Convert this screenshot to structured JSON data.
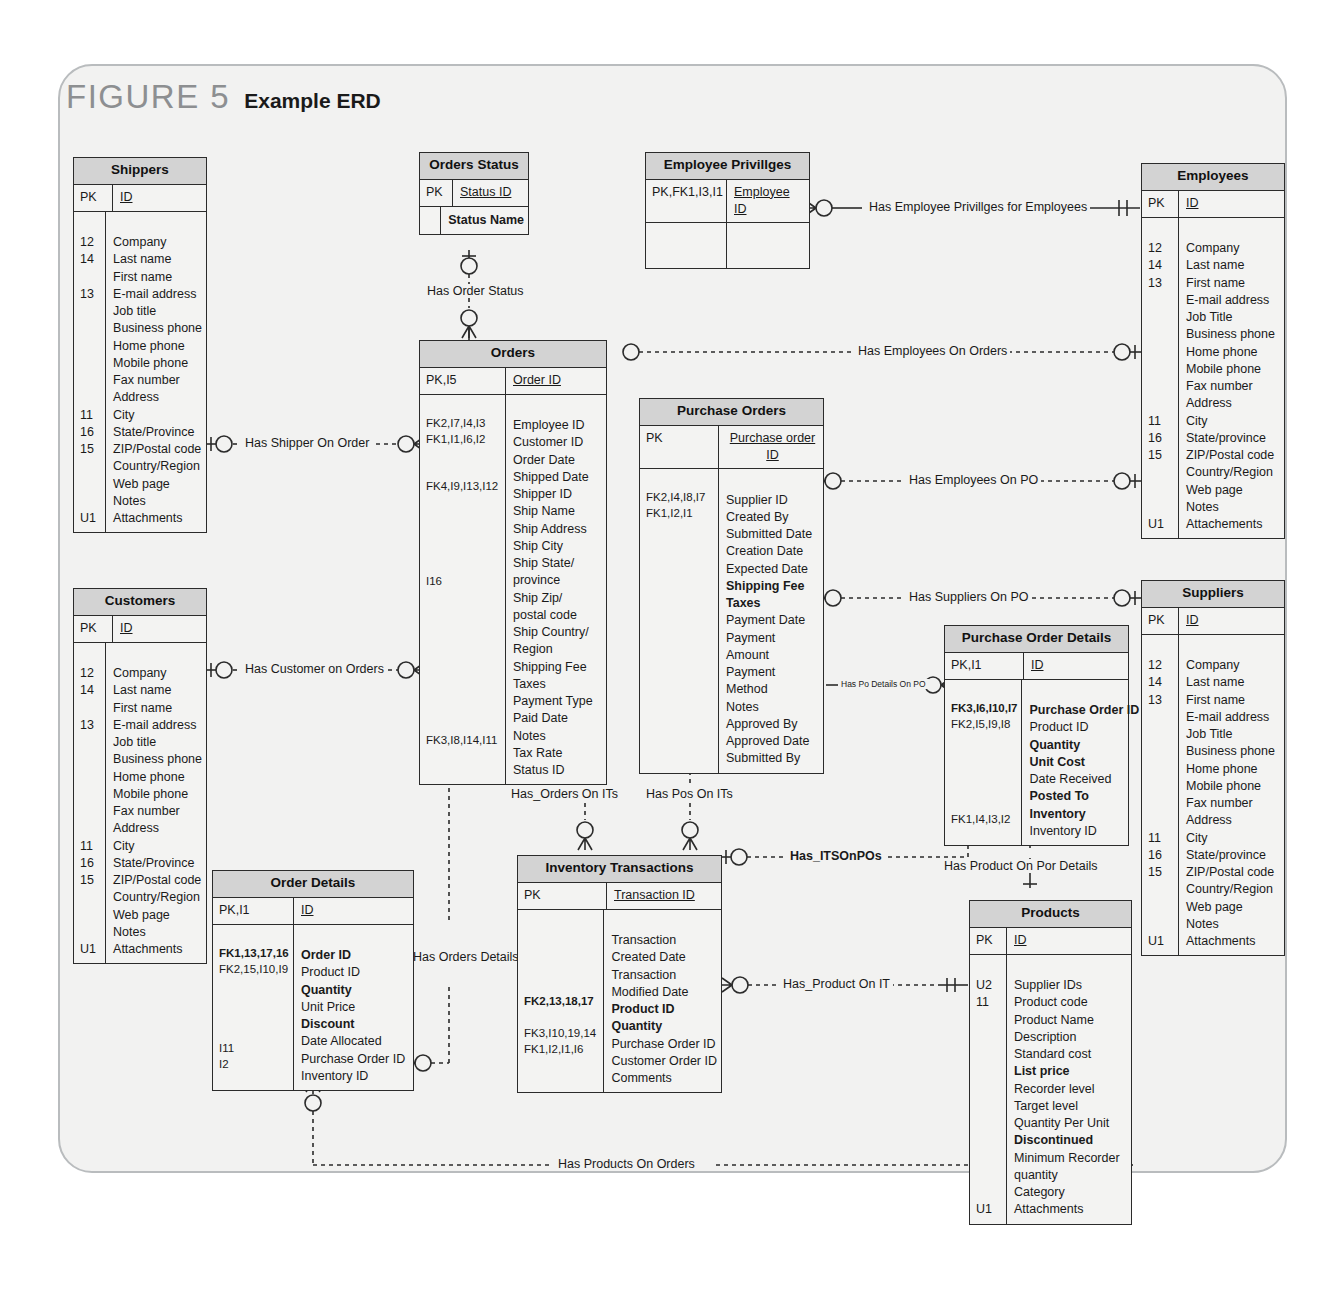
{
  "figure": {
    "number": "FIGURE 5",
    "title": "Example ERD"
  },
  "entities": {
    "shippers": {
      "name": "Shippers",
      "pk": {
        "key": "PK",
        "attr": "ID"
      },
      "rows": [
        {
          "key": "12",
          "attr": "Company"
        },
        {
          "key": "14",
          "attr": "Last name"
        },
        {
          "key": "",
          "attr": "First name"
        },
        {
          "key": "13",
          "attr": "E-mail address"
        },
        {
          "key": "",
          "attr": "Job title"
        },
        {
          "key": "",
          "attr": "Business phone"
        },
        {
          "key": "",
          "attr": "Home phone"
        },
        {
          "key": "",
          "attr": "Mobile phone"
        },
        {
          "key": "",
          "attr": "Fax number"
        },
        {
          "key": "",
          "attr": "Address"
        },
        {
          "key": "11",
          "attr": "City"
        },
        {
          "key": "16",
          "attr": "State/Province"
        },
        {
          "key": "15",
          "attr": "ZIP/Postal code"
        },
        {
          "key": "",
          "attr": "Country/Region"
        },
        {
          "key": "",
          "attr": "Web page"
        },
        {
          "key": "",
          "attr": "Notes"
        },
        {
          "key": "U1",
          "attr": "Attachments"
        }
      ]
    },
    "orders_status": {
      "name": "Orders Status",
      "pk": {
        "key": "PK",
        "attr": "Status ID"
      },
      "rows": [
        {
          "key": "",
          "attr": "Status Name",
          "bold": true
        }
      ]
    },
    "employee_privilges": {
      "name": "Employee Privillges",
      "pk": {
        "key": "PK,FK1,I3,I1",
        "attr": "Employee ID"
      },
      "rows": [
        {
          "key": "",
          "attr": ""
        }
      ]
    },
    "employees": {
      "name": "Employees",
      "pk": {
        "key": "PK",
        "attr": "ID"
      },
      "rows": [
        {
          "key": "12",
          "attr": "Company"
        },
        {
          "key": "14",
          "attr": "Last name"
        },
        {
          "key": "13",
          "attr": "First name"
        },
        {
          "key": "",
          "attr": "E-mail address"
        },
        {
          "key": "",
          "attr": "Job Title"
        },
        {
          "key": "",
          "attr": "Business phone"
        },
        {
          "key": "",
          "attr": "Home phone"
        },
        {
          "key": "",
          "attr": "Mobile phone"
        },
        {
          "key": "",
          "attr": "Fax number"
        },
        {
          "key": "",
          "attr": "Address"
        },
        {
          "key": "11",
          "attr": "City"
        },
        {
          "key": "16",
          "attr": "State/province"
        },
        {
          "key": "15",
          "attr": "ZIP/Postal code"
        },
        {
          "key": "",
          "attr": "Country/Region"
        },
        {
          "key": "",
          "attr": "Web page"
        },
        {
          "key": "",
          "attr": "Notes"
        },
        {
          "key": "U1",
          "attr": "Attachements"
        }
      ]
    },
    "orders": {
      "name": "Orders",
      "pk": {
        "key": "PK,I5",
        "attr": "Order ID"
      },
      "rows": [
        {
          "key": "FK2,I7,I4,I3",
          "attr": "Employee ID"
        },
        {
          "key": "FK1,I1,I6,I2",
          "attr": "Customer ID"
        },
        {
          "key": "",
          "attr": "Order Date"
        },
        {
          "key": "",
          "attr": "Shipped Date"
        },
        {
          "key": "FK4,I9,I13,I12",
          "attr": "Shipper ID"
        },
        {
          "key": "",
          "attr": "Ship Name"
        },
        {
          "key": "",
          "attr": "Ship Address"
        },
        {
          "key": "",
          "attr": "Ship City"
        },
        {
          "key": "",
          "attr": "Ship State/"
        },
        {
          "key": "",
          "attr": "province"
        },
        {
          "key": "I16",
          "attr": "Ship Zip/"
        },
        {
          "key": "",
          "attr": "postal code"
        },
        {
          "key": "",
          "attr": "Ship Country/"
        },
        {
          "key": "",
          "attr": "Region"
        },
        {
          "key": "",
          "attr": "Shipping Fee"
        },
        {
          "key": "",
          "attr": "Taxes"
        },
        {
          "key": "",
          "attr": "Payment Type"
        },
        {
          "key": "",
          "attr": "Paid Date"
        },
        {
          "key": "",
          "attr": "Notes"
        },
        {
          "key": "",
          "attr": "Tax Rate"
        },
        {
          "key": "FK3,I8,I14,I11",
          "attr": "Status ID"
        }
      ]
    },
    "purchase_orders": {
      "name": "Purchase Orders",
      "pk": {
        "key": "PK",
        "attr": "Purchase order ID"
      },
      "rows": [
        {
          "key": "FK2,I4,I8,I7",
          "attr": "Supplier ID"
        },
        {
          "key": "FK1,I2,I1",
          "attr": "Created By"
        },
        {
          "key": "",
          "attr": "Submitted Date"
        },
        {
          "key": "",
          "attr": "Creation Date"
        },
        {
          "key": "",
          "attr": "Expected Date"
        },
        {
          "key": "",
          "attr": "Shipping Fee",
          "bold": true
        },
        {
          "key": "",
          "attr": "Taxes",
          "bold": true
        },
        {
          "key": "",
          "attr": "Payment Date"
        },
        {
          "key": "",
          "attr": "Payment"
        },
        {
          "key": "",
          "attr": "Amount"
        },
        {
          "key": "",
          "attr": "Payment"
        },
        {
          "key": "",
          "attr": "Method"
        },
        {
          "key": "",
          "attr": "Notes"
        },
        {
          "key": "",
          "attr": "Approved By"
        },
        {
          "key": "",
          "attr": "Approved Date"
        },
        {
          "key": "",
          "attr": "Submitted By"
        }
      ]
    },
    "purchase_order_details": {
      "name": "Purchase Order Details",
      "pk": {
        "key": "PK,I1",
        "attr": "ID"
      },
      "rows": [
        {
          "key": "FK3,I6,I10,I7",
          "attr": "Purchase Order ID",
          "bold": true,
          "keybold": true
        },
        {
          "key": "FK2,I5,I9,I8",
          "attr": "Product ID"
        },
        {
          "key": "",
          "attr": "Quantity",
          "bold": true
        },
        {
          "key": "",
          "attr": "Unit Cost",
          "bold": true
        },
        {
          "key": "",
          "attr": "Date Received"
        },
        {
          "key": "",
          "attr": "Posted To",
          "bold": true
        },
        {
          "key": "",
          "attr": "Inventory",
          "bold": true
        },
        {
          "key": "FK1,I4,I3,I2",
          "attr": "Inventory ID"
        }
      ]
    },
    "suppliers": {
      "name": "Suppliers",
      "pk": {
        "key": "PK",
        "attr": "ID"
      },
      "rows": [
        {
          "key": "12",
          "attr": "Company"
        },
        {
          "key": "14",
          "attr": "Last name"
        },
        {
          "key": "13",
          "attr": "First name"
        },
        {
          "key": "",
          "attr": "E-mail address"
        },
        {
          "key": "",
          "attr": "Job Title"
        },
        {
          "key": "",
          "attr": "Business phone"
        },
        {
          "key": "",
          "attr": "Home phone"
        },
        {
          "key": "",
          "attr": "Mobile phone"
        },
        {
          "key": "",
          "attr": "Fax number"
        },
        {
          "key": "",
          "attr": "Address"
        },
        {
          "key": "11",
          "attr": "City"
        },
        {
          "key": "16",
          "attr": "State/province"
        },
        {
          "key": "15",
          "attr": "ZIP/Postal code"
        },
        {
          "key": "",
          "attr": "Country/Region"
        },
        {
          "key": "",
          "attr": "Web page"
        },
        {
          "key": "",
          "attr": "Notes"
        },
        {
          "key": "U1",
          "attr": "Attachments"
        }
      ]
    },
    "customers": {
      "name": "Customers",
      "pk": {
        "key": "PK",
        "attr": "ID"
      },
      "rows": [
        {
          "key": "12",
          "attr": "Company"
        },
        {
          "key": "14",
          "attr": "Last name"
        },
        {
          "key": "",
          "attr": "First name"
        },
        {
          "key": "13",
          "attr": "E-mail address"
        },
        {
          "key": "",
          "attr": "Job title"
        },
        {
          "key": "",
          "attr": "Business phone"
        },
        {
          "key": "",
          "attr": "Home phone"
        },
        {
          "key": "",
          "attr": "Mobile phone"
        },
        {
          "key": "",
          "attr": "Fax number"
        },
        {
          "key": "",
          "attr": "Address"
        },
        {
          "key": "11",
          "attr": "City"
        },
        {
          "key": "16",
          "attr": "State/Province"
        },
        {
          "key": "15",
          "attr": "ZIP/Postal code"
        },
        {
          "key": "",
          "attr": "Country/Region"
        },
        {
          "key": "",
          "attr": "Web page"
        },
        {
          "key": "",
          "attr": "Notes"
        },
        {
          "key": "U1",
          "attr": "Attachments"
        }
      ]
    },
    "order_details": {
      "name": "Order Details",
      "pk": {
        "key": "PK,I1",
        "attr": "ID"
      },
      "rows": [
        {
          "key": "FK1,13,17,16",
          "attr": "Order ID",
          "bold": true,
          "keybold": true
        },
        {
          "key": "FK2,15,I10,I9",
          "attr": "Product ID"
        },
        {
          "key": "",
          "attr": "Quantity",
          "bold": true
        },
        {
          "key": "",
          "attr": "Unit Price"
        },
        {
          "key": "",
          "attr": "Discount",
          "bold": true
        },
        {
          "key": "",
          "attr": "Date Allocated"
        },
        {
          "key": "I11",
          "attr": "Purchase Order ID"
        },
        {
          "key": "I2",
          "attr": "Inventory ID"
        }
      ]
    },
    "inventory_transactions": {
      "name": "Inventory Transactions",
      "pk": {
        "key": "PK",
        "attr": "Transaction ID"
      },
      "rows": [
        {
          "key": "",
          "attr": "Transaction"
        },
        {
          "key": "",
          "attr": "Created Date"
        },
        {
          "key": "",
          "attr": "Transaction"
        },
        {
          "key": "",
          "attr": "Modified Date"
        },
        {
          "key": "FK2,13,18,17",
          "attr": "Product ID",
          "bold": true,
          "keybold": true
        },
        {
          "key": "",
          "attr": "Quantity",
          "bold": true
        },
        {
          "key": "FK3,I10,19,14",
          "attr": "Purchase Order ID"
        },
        {
          "key": "FK1,I2,I1,I6",
          "attr": "Customer Order ID"
        },
        {
          "key": "",
          "attr": "Comments"
        }
      ]
    },
    "products": {
      "name": "Products",
      "pk": {
        "key": "PK",
        "attr": "ID"
      },
      "rows": [
        {
          "key": "U2",
          "attr": "Supplier IDs"
        },
        {
          "key": "11",
          "attr": "Product code"
        },
        {
          "key": "",
          "attr": "Product Name"
        },
        {
          "key": "",
          "attr": "Description"
        },
        {
          "key": "",
          "attr": "Standard cost"
        },
        {
          "key": "",
          "attr": "List price",
          "bold": true
        },
        {
          "key": "",
          "attr": "Recorder level"
        },
        {
          "key": "",
          "attr": "Target level"
        },
        {
          "key": "",
          "attr": "Quantity Per Unit"
        },
        {
          "key": "",
          "attr": "Discontinued",
          "bold": true
        },
        {
          "key": "",
          "attr": "Minimum Recorder"
        },
        {
          "key": "",
          "attr": "quantity"
        },
        {
          "key": "",
          "attr": "Category"
        },
        {
          "key": "U1",
          "attr": "Attachments"
        }
      ]
    }
  },
  "relationships": {
    "has_order_status": "Has Order Status",
    "has_employee_privilges": "Has Employee Privillges for Employees",
    "has_employees_on_orders": "Has Employees On Orders",
    "has_shipper_on_order": "Has Shipper On Order",
    "has_employees_on_po": "Has Employees On PO",
    "has_suppliers_on_po": "Has Suppliers On PO",
    "has_customer_on_orders": "Has Customer on Orders",
    "has_po_details_on_po": "Has Po Details On PO",
    "has_orders_on_its": "Has_Orders On ITs",
    "has_pos_on_its": "Has Pos On ITs",
    "has_itsonpos": "Has_ITSOnPOs",
    "has_product_on_por_details": "Has Product On Por Details",
    "has_orders_details": "Has  Orders Details",
    "has_product_on_it": "Has_Product On IT",
    "has_products_on_orders": "Has Products On Orders"
  },
  "colors": {
    "header_fill": "#d3d3d3",
    "body_fill": "#f3f3f2",
    "page_fill": "#f2f2f1",
    "line": "#2b2b2b",
    "figure_number": "#8d8f91"
  }
}
